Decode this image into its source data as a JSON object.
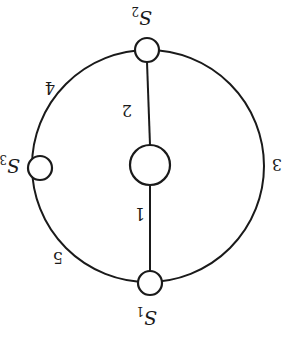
{
  "diagram": {
    "type": "graph",
    "orientation": "rotated-180",
    "stroke_color": "#1a1a1a",
    "background": "#ffffff",
    "outer_circle": {
      "cx": 148,
      "cy": 166,
      "r": 116
    },
    "nodes": [
      {
        "id": "S1",
        "name": "S",
        "subscript": "1",
        "cx": 150,
        "cy": 283,
        "r": 12
      },
      {
        "id": "S2",
        "name": "S",
        "subscript": "2",
        "cx": 147,
        "cy": 50,
        "r": 12
      },
      {
        "id": "S3",
        "name": "S",
        "subscript": "3",
        "cx": 40,
        "cy": 168,
        "r": 12
      },
      {
        "id": "C",
        "name": "",
        "subscript": "",
        "cx": 150,
        "cy": 165,
        "r": 20
      }
    ],
    "edges": [
      {
        "label": "1",
        "from": "S1",
        "to": "C",
        "kind": "chord"
      },
      {
        "label": "2",
        "from": "C",
        "to": "S2",
        "kind": "chord"
      },
      {
        "label": "3",
        "from": "S1",
        "to": "S2",
        "kind": "arc-right"
      },
      {
        "label": "4",
        "from": "S2",
        "to": "S3",
        "kind": "arc-left-upper"
      },
      {
        "label": "5",
        "from": "S3",
        "to": "S1",
        "kind": "arc-left-lower"
      }
    ],
    "edge_labels": {
      "e1": "1",
      "e2": "2",
      "e3": "3",
      "e4": "4",
      "e5": "5"
    },
    "node_labels": {
      "s1": {
        "main": "S",
        "sub": "1"
      },
      "s2": {
        "main": "S",
        "sub": "2"
      },
      "s3": {
        "main": "S",
        "sub": "3"
      }
    }
  }
}
